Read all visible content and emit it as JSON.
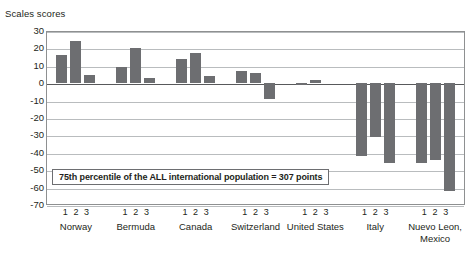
{
  "chart_data": {
    "type": "bar",
    "title": "",
    "ylabel": "Scales scores",
    "xlabel": "",
    "ylim": [
      -70,
      30
    ],
    "ytick_step": 10,
    "yticks": [
      "30",
      "20",
      "10",
      "0",
      "-10",
      "-20",
      "-30",
      "-40",
      "-50",
      "-60",
      "-70"
    ],
    "grid": true,
    "legend": "none",
    "bar_color": "#6d6e71",
    "series_labels": [
      "1",
      "2",
      "3"
    ],
    "categories": [
      "Norway",
      "Bermuda",
      "Canada",
      "Switzerland",
      "United States",
      "Italy",
      "Nuevo Leon, Mexico"
    ],
    "category_lines": [
      [
        "Norway"
      ],
      [
        "Bermuda"
      ],
      [
        "Canada"
      ],
      [
        "Switzerland"
      ],
      [
        "United States"
      ],
      [
        "Italy"
      ],
      [
        "Nuevo Leon,",
        "Mexico"
      ]
    ],
    "series": [
      {
        "name": "1",
        "values": [
          16,
          9.5,
          14,
          7,
          -1,
          -42,
          -46
        ]
      },
      {
        "name": "2",
        "values": [
          24,
          20,
          17.5,
          6,
          2,
          -31,
          -44
        ]
      },
      {
        "name": "3",
        "values": [
          5,
          3,
          4,
          -9,
          0,
          -46,
          -62
        ]
      }
    ],
    "annotations": [
      {
        "text": "75th percentile of the ALL international population = 307 points",
        "value": 307
      }
    ]
  }
}
